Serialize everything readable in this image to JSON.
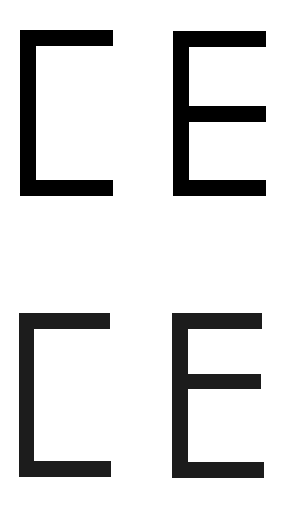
{
  "rows": [
    {
      "letters": [
        "C",
        "E"
      ],
      "color": "#000000",
      "style": "sharp"
    },
    {
      "letters": [
        "C",
        "E"
      ],
      "color": "#1c1c1c",
      "style": "slightly-blurred"
    }
  ],
  "background": "#ffffff"
}
